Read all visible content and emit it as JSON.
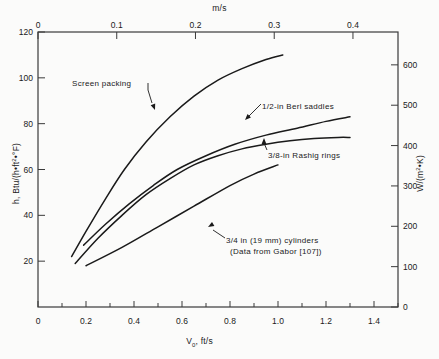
{
  "figure": {
    "background_color": "#fbfbfa",
    "line_color": "#1a1a1a",
    "axis_color": "#3a3a3a"
  },
  "axes": {
    "top": {
      "title": "m/s",
      "ticks": [
        "0",
        "0.1",
        "0.2",
        "0.3",
        "0.4"
      ],
      "values": [
        0,
        0.1,
        0.2,
        0.3,
        0.4
      ],
      "range": [
        0,
        0.4572
      ]
    },
    "bottom": {
      "title_main": "V",
      "title_sub": "0",
      "title_rest": ", ft/s",
      "title": "V0, ft/s",
      "ticks": [
        "0",
        "0.2",
        "0.4",
        "0.6",
        "0.8",
        "1.0",
        "1.2",
        "1.4"
      ],
      "values": [
        0,
        0.2,
        0.4,
        0.6,
        0.8,
        1.0,
        1.2,
        1.4
      ],
      "minor_step": 0.1,
      "range": [
        0,
        1.5
      ]
    },
    "left": {
      "title": "h, Btu/(h•ft2•°F)",
      "title_pre": "h, Btu/(h•ft",
      "title_sup": "2",
      "title_post": "•°F)",
      "ticks": [
        "20",
        "40",
        "60",
        "80",
        "100",
        "120"
      ],
      "values": [
        20,
        40,
        60,
        80,
        100,
        120
      ],
      "range": [
        0,
        120
      ]
    },
    "right": {
      "title": "W/(m2•K)",
      "title_pre": "W/(m",
      "title_sup": "2",
      "title_post": "•K)",
      "ticks": [
        "0",
        "100",
        "200",
        "300",
        "400",
        "500",
        "600"
      ],
      "values": [
        0,
        100,
        200,
        300,
        400,
        500,
        600
      ],
      "range": [
        0,
        681
      ]
    }
  },
  "annotations": {
    "screen_packing": "Screen packing",
    "berl_saddles": "1/2-in Berl saddles",
    "raschig_rings": "3/8-in Rashig rings",
    "cylinders_line1": "3/4 in (19 mm) cylinders",
    "cylinders_line2": "(Data from Gabor [107])"
  },
  "chart_data": {
    "type": "line",
    "title": "",
    "xlabel": "V0, ft/s",
    "ylabel": "h, Btu/(h•ft2•°F)",
    "xlabel_secondary": "m/s",
    "ylabel_secondary": "W/(m2•K)",
    "xlim": [
      0,
      1.5
    ],
    "ylim": [
      0,
      120
    ],
    "xlim_secondary": [
      0,
      0.4572
    ],
    "ylim_secondary": [
      0,
      681
    ],
    "grid": false,
    "legend": "inline-annotations",
    "series": [
      {
        "name": "Screen packing",
        "x": [
          0.14,
          0.2,
          0.28,
          0.36,
          0.45,
          0.55,
          0.65,
          0.75,
          0.85,
          0.95,
          1.02
        ],
        "y": [
          22,
          33,
          47,
          60,
          72,
          83,
          92,
          99,
          104,
          108,
          110
        ]
      },
      {
        "name": "1/2-in Berl saddles",
        "x": [
          0.19,
          0.28,
          0.38,
          0.48,
          0.58,
          0.7,
          0.82,
          0.95,
          1.08,
          1.2,
          1.3
        ],
        "y": [
          27,
          36,
          45,
          53,
          60,
          66,
          71,
          75,
          78,
          81,
          83
        ]
      },
      {
        "name": "3/8-in Rashig rings",
        "x": [
          0.155,
          0.25,
          0.35,
          0.45,
          0.55,
          0.65,
          0.75,
          0.85,
          0.95,
          1.05,
          1.15,
          1.25,
          1.3
        ],
        "y": [
          19,
          30,
          40,
          49,
          56,
          62,
          66,
          69,
          71,
          72.5,
          73.5,
          74,
          74
        ]
      },
      {
        "name": "3/4 in (19 mm) cylinders",
        "x": [
          0.2,
          0.35,
          0.5,
          0.65,
          0.8,
          0.9,
          1.0
        ],
        "y": [
          18,
          26,
          35,
          44,
          53,
          58,
          62
        ]
      }
    ]
  }
}
